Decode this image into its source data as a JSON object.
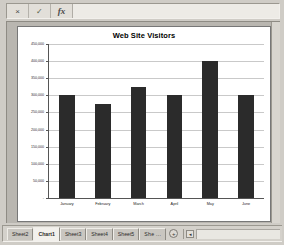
{
  "formula_bar": {
    "cancel_icon": "×",
    "cancel_name": "cancel-icon",
    "enter_icon": "✓",
    "enter_name": "check-icon",
    "function_icon": "fx",
    "function_name": "insert-function-icon",
    "value": "",
    "placeholder": ""
  },
  "chart_data": {
    "type": "bar",
    "title": "Web Site Visitors",
    "xlabel": "",
    "ylabel": "",
    "categories": [
      "January",
      "February",
      "March",
      "April",
      "May",
      "June"
    ],
    "values": [
      300000,
      275000,
      325000,
      300000,
      400000,
      300000
    ],
    "ylim": [
      0,
      450000
    ],
    "ytick_step": 50000,
    "ytick_labels": [
      "450,000",
      "400,000",
      "350,000",
      "300,000",
      "250,000",
      "200,000",
      "150,000",
      "100,000",
      "50,000",
      "-"
    ],
    "ytick_values": [
      450000,
      400000,
      350000,
      300000,
      250000,
      200000,
      150000,
      100000,
      50000,
      0
    ],
    "grid": true,
    "legend": false,
    "legend_position": "none",
    "series_color": "#2b2b2b",
    "plot_background": "#ffffff"
  },
  "tabbar": {
    "tabs": [
      {
        "label": "Sheet2",
        "active": false
      },
      {
        "label": "Chart1",
        "active": true
      },
      {
        "label": "Sheet3",
        "active": false
      },
      {
        "label": "Sheet4",
        "active": false
      },
      {
        "label": "Sheet5",
        "active": false
      },
      {
        "label": "She ...",
        "active": false
      }
    ],
    "add_sheet_label": "+",
    "nav_label": "◂"
  }
}
